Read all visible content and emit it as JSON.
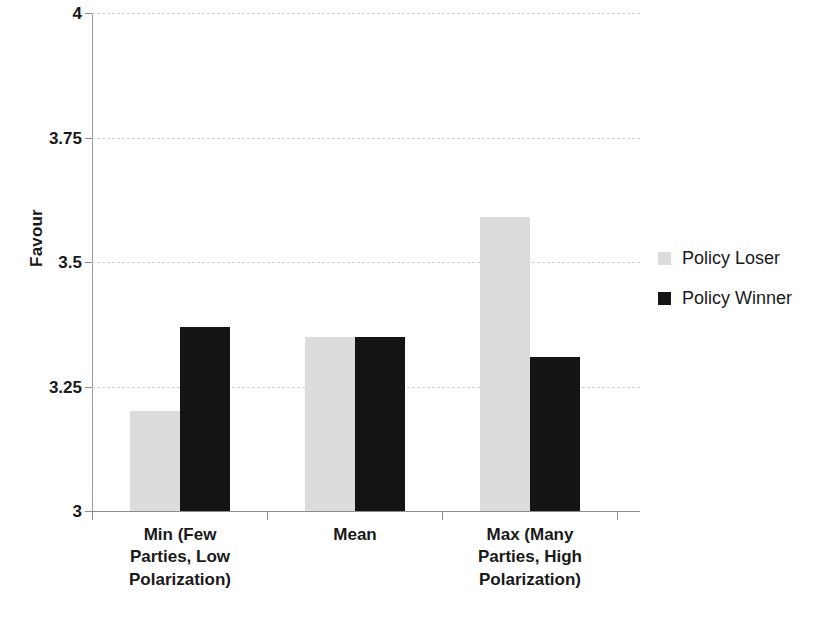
{
  "chart_data": {
    "type": "bar",
    "title": "",
    "xlabel": "",
    "ylabel": "Favour",
    "ylim": [
      3,
      4
    ],
    "yticks": [
      "3",
      "3.25",
      "3.5",
      "3.75",
      "4"
    ],
    "ytick_values": [
      3,
      3.25,
      3.5,
      3.75,
      4
    ],
    "grid": true,
    "legend_position": "right",
    "categories": [
      "Min (Few Parties, Low Polarization)",
      "Mean",
      "Max (Many Parties, High Polarization)"
    ],
    "category_lines": [
      [
        "Min (Few",
        "Parties, Low",
        "Polarization)"
      ],
      [
        "Mean"
      ],
      [
        "Max (Many",
        "Parties, High",
        "Polarization)"
      ]
    ],
    "series": [
      {
        "name": "Policy Loser",
        "color": "#dcdcdc",
        "values": [
          3.2,
          3.35,
          3.59
        ]
      },
      {
        "name": "Policy Winner",
        "color": "#141414",
        "values": [
          3.37,
          3.35,
          3.31
        ]
      }
    ]
  },
  "legend": {
    "items": [
      {
        "label": "Policy Loser",
        "swatch": "light-gray-swatch"
      },
      {
        "label": "Policy Winner",
        "swatch": "black-swatch"
      }
    ]
  }
}
